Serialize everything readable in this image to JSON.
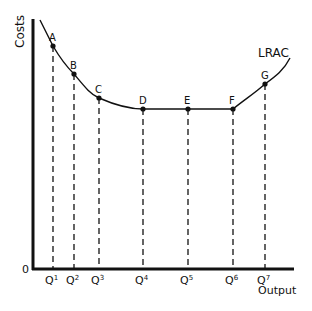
{
  "chart_data": {
    "type": "line",
    "title": "",
    "xlabel": "Output",
    "ylabel": "Costs",
    "origin_label": "0",
    "series": [
      {
        "name": "LRAC",
        "points": [
          {
            "label": "A",
            "x": "Q1",
            "px": 53,
            "py": 46
          },
          {
            "label": "B",
            "x": "Q2",
            "px": 74,
            "py": 74
          },
          {
            "label": "C",
            "x": "Q3",
            "px": 99,
            "py": 98
          },
          {
            "label": "D",
            "x": "Q4",
            "px": 143,
            "py": 109
          },
          {
            "label": "E",
            "x": "Q5",
            "px": 188,
            "py": 109
          },
          {
            "label": "F",
            "x": "Q6",
            "px": 233,
            "py": 109
          },
          {
            "label": "G",
            "x": "Q7",
            "px": 265,
            "py": 84
          }
        ]
      }
    ],
    "categories": [
      "Q1",
      "Q2",
      "Q3",
      "Q4",
      "Q5",
      "Q6",
      "Q7"
    ],
    "tick_labels": [
      {
        "base": "Q",
        "sup": "1"
      },
      {
        "base": "Q",
        "sup": "2"
      },
      {
        "base": "Q",
        "sup": "3"
      },
      {
        "base": "Q",
        "sup": "4"
      },
      {
        "base": "Q",
        "sup": "5"
      },
      {
        "base": "Q",
        "sup": "6"
      },
      {
        "base": "Q",
        "sup": "7"
      }
    ],
    "curve_label": "LRAC",
    "grid": false,
    "legend": "none"
  }
}
